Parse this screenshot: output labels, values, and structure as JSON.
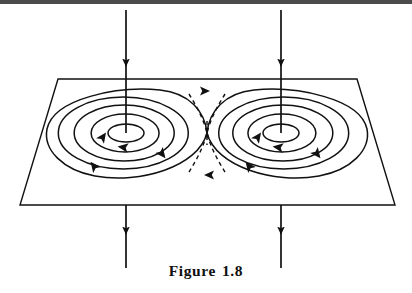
{
  "figure": {
    "caption_label": "Figure",
    "caption_number": "1.8",
    "caption_full": "Figure  1.8",
    "line_color": "#111111",
    "dash_color": "#111111",
    "background_color": "#ffffff",
    "scan_band_color": "#2b2b2b"
  },
  "plane": {
    "name": "tilted-plane",
    "corners": {
      "top_left": {
        "x": 58,
        "y": 79
      },
      "top_right": {
        "x": 357,
        "y": 79
      },
      "bottom_right": {
        "x": 395,
        "y": 205
      },
      "bottom_left": {
        "x": 20,
        "y": 205
      }
    },
    "points": "58,79 357,79 395,205 20,205",
    "stroke_width": "1.4"
  },
  "vortices": [
    {
      "name": "left-vortex",
      "center": {
        "x": 126,
        "y": 133
      },
      "rotation": "clockwise",
      "rings": [
        {
          "rx": 18,
          "ry": 9
        },
        {
          "rx": 34,
          "ry": 19
        },
        {
          "rx": 50,
          "ry": 28
        },
        {
          "rx": 65,
          "ry": 36
        },
        {
          "rx": 79,
          "ry": 43
        }
      ]
    },
    {
      "name": "right-vortex",
      "center": {
        "x": 281,
        "y": 133
      },
      "rotation": "clockwise",
      "rings": [
        {
          "rx": 18,
          "ry": 9
        },
        {
          "rx": 34,
          "ry": 19
        },
        {
          "rx": 50,
          "ry": 28
        },
        {
          "rx": 65,
          "ry": 36
        },
        {
          "rx": 79,
          "ry": 43
        }
      ]
    }
  ],
  "saddle": {
    "name": "saddle-point",
    "center": {
      "x": 207,
      "y": 133
    },
    "separatrix_style": "dashed",
    "dash_pattern": "4,3.5"
  },
  "field_lines": [
    {
      "name": "inflow-line-left",
      "x": 126,
      "y_start": 10,
      "y_end": 133,
      "arrow_y": 65,
      "direction": "down"
    },
    {
      "name": "inflow-line-right",
      "x": 281,
      "y_start": 10,
      "y_end": 133,
      "arrow_y": 65,
      "direction": "down"
    },
    {
      "name": "outflow-line-left",
      "x": 126,
      "y_start": 205,
      "y_end": 268,
      "arrow_y": 232,
      "direction": "down"
    },
    {
      "name": "outflow-line-right",
      "x": 281,
      "y_start": 205,
      "y_end": 268,
      "arrow_y": 232,
      "direction": "down"
    }
  ],
  "flow_arrows": [
    {
      "name": "flow-arrow-separatrix-top",
      "x": 207,
      "y": 94,
      "angle": 0
    },
    {
      "name": "flow-arrow-separatrix-bottom",
      "x": 207,
      "y": 172,
      "angle": 180
    },
    {
      "name": "flow-arrow-left-inner",
      "x": 124,
      "y": 145,
      "angle": 195
    },
    {
      "name": "flow-arrow-left-upper",
      "x": 96,
      "y": 138,
      "angle": 300
    },
    {
      "name": "flow-arrow-left-right",
      "x": 163,
      "y": 152,
      "angle": 55
    },
    {
      "name": "flow-arrow-left-lower",
      "x": 93,
      "y": 167,
      "angle": 240
    },
    {
      "name": "flow-arrow-right-inner",
      "x": 279,
      "y": 145,
      "angle": 195
    },
    {
      "name": "flow-arrow-right-upper",
      "x": 251,
      "y": 138,
      "angle": 300
    },
    {
      "name": "flow-arrow-right-right",
      "x": 318,
      "y": 152,
      "angle": 55
    },
    {
      "name": "flow-arrow-right-lower",
      "x": 246,
      "y": 167,
      "angle": 240
    }
  ]
}
